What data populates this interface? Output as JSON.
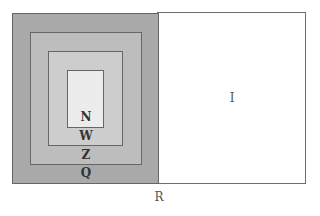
{
  "diagram": {
    "regions": [
      {
        "id": "R",
        "label": "R",
        "role": "universe"
      },
      {
        "id": "I",
        "label": "I",
        "role": "right-set"
      },
      {
        "id": "Q",
        "label": "Q",
        "role": "outer-nested"
      },
      {
        "id": "Z",
        "label": "Z",
        "role": "nested"
      },
      {
        "id": "W",
        "label": "W",
        "role": "nested"
      },
      {
        "id": "N",
        "label": "N",
        "role": "innermost"
      }
    ],
    "labels": {
      "R": "R",
      "I": "I",
      "Q": "Q",
      "Z": "Z",
      "W": "W",
      "N": "N"
    },
    "colors": {
      "Q": "#a9a9a9",
      "Z": "#bdbdbd",
      "W": "#cdcdcd",
      "N": "#ececec",
      "I": "#ffffff"
    }
  }
}
